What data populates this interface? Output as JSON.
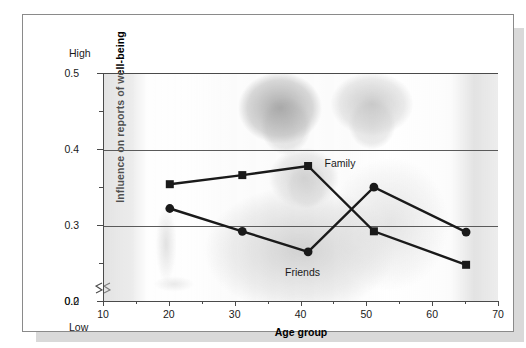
{
  "chart_data": {
    "type": "line",
    "title": "",
    "xlabel": "Age group",
    "ylabel": "Influence on reports of well-being",
    "xlim": [
      10,
      70
    ],
    "ylim": [
      0.2,
      0.5
    ],
    "y_axis_break": true,
    "grid": true,
    "legend_position": "inline-annotation",
    "x": [
      20,
      31,
      41,
      51,
      65
    ],
    "series": [
      {
        "name": "Family",
        "marker": "square",
        "values": [
          0.355,
          0.367,
          0.379,
          0.293,
          0.249
        ]
      },
      {
        "name": "Friends",
        "marker": "circle",
        "values": [
          0.323,
          0.293,
          0.266,
          0.351,
          0.292
        ]
      }
    ],
    "x_ticks": [
      {
        "value": 10,
        "label": "10"
      },
      {
        "value": 15,
        "label": ""
      },
      {
        "value": 20,
        "label": "20"
      },
      {
        "value": 25,
        "label": ""
      },
      {
        "value": 30,
        "label": "30"
      },
      {
        "value": 35,
        "label": ""
      },
      {
        "value": 40,
        "label": "40"
      },
      {
        "value": 45,
        "label": ""
      },
      {
        "value": 50,
        "label": "50"
      },
      {
        "value": 55,
        "label": ""
      },
      {
        "value": 60,
        "label": "60"
      },
      {
        "value": 65,
        "label": ""
      },
      {
        "value": 70,
        "label": "70"
      }
    ],
    "y_ticks": [
      {
        "value": 0.5,
        "label": "0.5",
        "major": true
      },
      {
        "value": 0.45,
        "label": "",
        "major": false
      },
      {
        "value": 0.4,
        "label": "0.4",
        "major": true
      },
      {
        "value": 0.35,
        "label": "",
        "major": false
      },
      {
        "value": 0.3,
        "label": "0.3",
        "major": true
      },
      {
        "value": 0.25,
        "label": "",
        "major": false
      },
      {
        "value": 0.2,
        "label": "0.2",
        "major": true
      }
    ],
    "y_break_label": "0.0",
    "axis_caption_high": "High",
    "axis_caption_low": "Low",
    "annotations": [
      {
        "text": "Family",
        "x": 43.5,
        "y": 0.383
      },
      {
        "text": "Friends",
        "x": 37.5,
        "y": 0.24
      }
    ],
    "colors": {
      "line": "#1a1a1a",
      "grid": "#5a5a5a",
      "axis": "#4a4a4a",
      "card_border": "#8a8a8a",
      "card_shadow": "#d9d9d9",
      "background": "#ffffff"
    },
    "background_image_description": "faded grayscale photograph of three smiling family members"
  }
}
